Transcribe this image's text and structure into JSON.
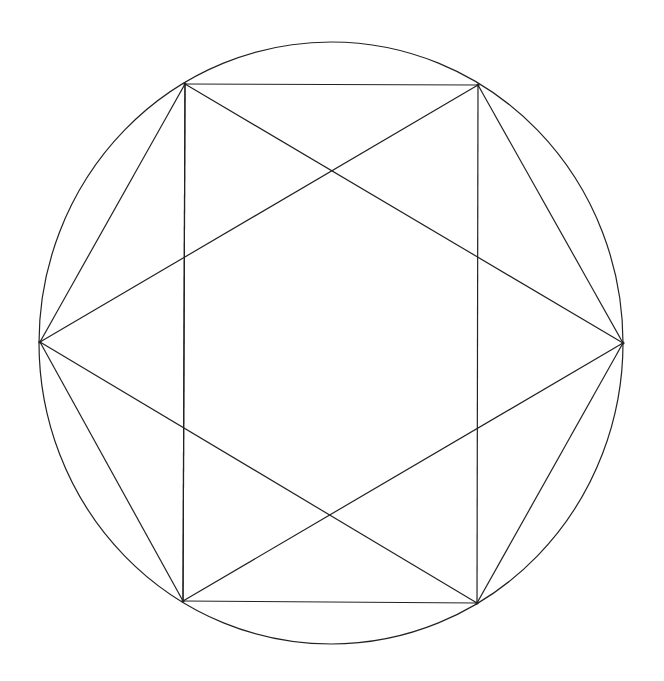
{
  "diagram": {
    "type": "inscribed-polygon-construction",
    "stroke_color": "#222222",
    "background": "#ffffff",
    "circle": {
      "cx": 331,
      "cy": 343,
      "rx": 292,
      "ry": 301
    },
    "vertices": {
      "top_left": [
        185,
        84
      ],
      "top_right": [
        478,
        85
      ],
      "left": [
        40,
        342
      ],
      "right": [
        623,
        343
      ],
      "bottom_left": [
        183,
        601
      ],
      "bottom_right": [
        477,
        603
      ]
    },
    "segments": [
      [
        "top_left",
        "top_right"
      ],
      [
        "bottom_left",
        "bottom_right"
      ],
      [
        "top_left",
        "bottom_left"
      ],
      [
        "top_right",
        "bottom_right"
      ],
      [
        "left",
        "top_left"
      ],
      [
        "left",
        "bottom_left"
      ],
      [
        "right",
        "top_right"
      ],
      [
        "right",
        "bottom_right"
      ],
      [
        "top_left",
        "right"
      ],
      [
        "right",
        "bottom_left"
      ],
      [
        "bottom_left",
        "top_left"
      ],
      [
        "top_right",
        "left"
      ],
      [
        "left",
        "bottom_right"
      ]
    ]
  }
}
